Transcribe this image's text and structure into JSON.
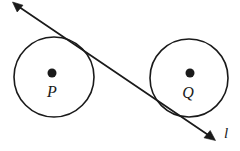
{
  "figure": {
    "type": "geometry-diagram",
    "background_color": "#ffffff",
    "stroke_color": "#1a1a1a",
    "circles": [
      {
        "id": "circle-p",
        "label": "P",
        "center_label_dot": true,
        "cx": 54,
        "cy": 77,
        "r": 40,
        "label_x": 52,
        "label_y": 97,
        "center_dot_x": 52,
        "center_dot_y": 73,
        "center_dot_r": 4.5
      },
      {
        "id": "circle-q",
        "label": "Q",
        "center_label_dot": true,
        "cx": 189,
        "cy": 78,
        "r": 39,
        "label_x": 188,
        "label_y": 98,
        "center_dot_x": 190,
        "center_dot_y": 73,
        "center_dot_r": 4.5
      }
    ],
    "tangent_line": {
      "id": "line-l",
      "label": "l",
      "label_x": 226,
      "label_y": 138,
      "x1": 13,
      "y1": 3,
      "x2": 214,
      "y2": 139,
      "stroke_width": 1.7,
      "arrow_start": true,
      "arrow_end": true
    }
  }
}
